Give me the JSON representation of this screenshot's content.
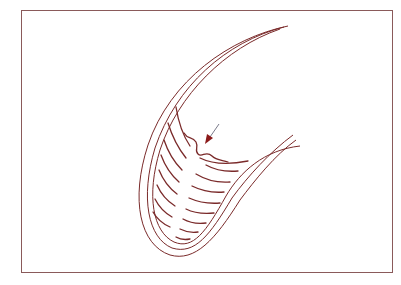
{
  "figure": {
    "type": "line-drawing",
    "labels": [],
    "colors": {
      "stroke": "#7a2a2a",
      "frame": "#8a4a4a",
      "arrow_head": "#8b1a1a",
      "arrow_shaft": "#7a7a8a",
      "background": "#ffffff"
    },
    "arrow": {
      "from": [
        219,
        124
      ],
      "to": [
        206,
        143
      ]
    },
    "lamellae_count": 20
  }
}
